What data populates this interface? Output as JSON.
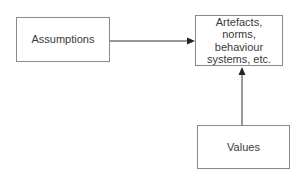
{
  "diagram": {
    "nodes": [
      {
        "id": "assumptions",
        "label": "Assumptions"
      },
      {
        "id": "artefacts",
        "label": "Artefacts,\nnorms,\nbehaviour\nsystems, etc."
      },
      {
        "id": "values",
        "label": "Values"
      }
    ],
    "edges": [
      {
        "from": "assumptions",
        "to": "artefacts",
        "direction": "right"
      },
      {
        "from": "values",
        "to": "artefacts",
        "direction": "up"
      }
    ],
    "colors": {
      "line": "#333333",
      "border": "#8a8a8a",
      "text": "#3a3a3a"
    }
  }
}
